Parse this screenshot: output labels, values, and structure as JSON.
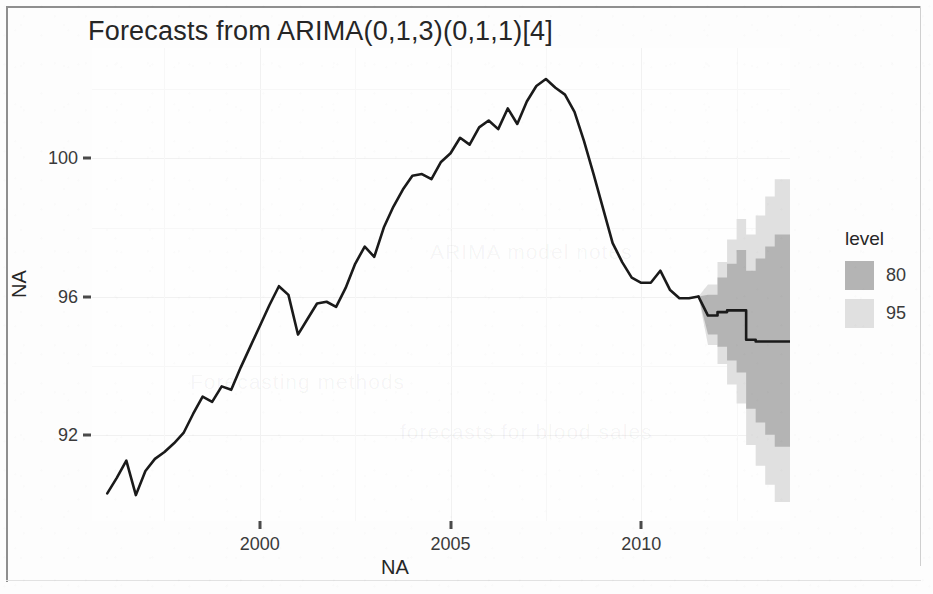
{
  "chart_data": {
    "type": "line",
    "title": "Forecasts from ARIMA(0,1,3)(0,1,1)[4]",
    "xlabel": "NA",
    "ylabel": "NA",
    "xlim": [
      1995.6,
      2013.9
    ],
    "ylim": [
      89.5,
      103.2
    ],
    "xticks": [
      2000,
      2005,
      2010
    ],
    "xtick_labels": [
      "2000",
      "2005",
      "2010"
    ],
    "yticks": [
      92,
      96,
      100
    ],
    "ytick_labels": [
      "92",
      "96",
      "100"
    ],
    "grid": true,
    "legend": {
      "title": "level",
      "position": "right",
      "entries": [
        {
          "label": "80",
          "color": "#b4b4b4"
        },
        {
          "label": "95",
          "color": "#e0e0e0"
        }
      ]
    },
    "series": [
      {
        "name": "observed",
        "color": "#1a1a1a",
        "x": [
          1996.0,
          1996.25,
          1996.5,
          1996.75,
          1997.0,
          1997.25,
          1997.5,
          1997.75,
          1998.0,
          1998.25,
          1998.5,
          1998.75,
          1999.0,
          1999.25,
          1999.5,
          1999.75,
          2000.0,
          2000.25,
          2000.5,
          2000.75,
          2001.0,
          2001.25,
          2001.5,
          2001.75,
          2002.0,
          2002.25,
          2002.5,
          2002.75,
          2003.0,
          2003.25,
          2003.5,
          2003.75,
          2004.0,
          2004.25,
          2004.5,
          2004.75,
          2005.0,
          2005.25,
          2005.5,
          2005.75,
          2006.0,
          2006.25,
          2006.5,
          2006.75,
          2007.0,
          2007.25,
          2007.5,
          2007.75,
          2008.0,
          2008.25,
          2008.5,
          2008.75,
          2009.0,
          2009.25,
          2009.5,
          2009.75,
          2010.0,
          2010.25,
          2010.5,
          2010.75,
          2011.0,
          2011.25,
          2011.5
        ],
        "values": [
          90.3,
          90.75,
          91.25,
          90.25,
          90.95,
          91.3,
          91.5,
          91.75,
          92.05,
          92.6,
          93.1,
          92.95,
          93.4,
          93.3,
          93.95,
          94.55,
          95.15,
          95.75,
          96.3,
          96.05,
          94.9,
          95.35,
          95.8,
          95.85,
          95.7,
          96.25,
          96.95,
          97.45,
          97.15,
          98.0,
          98.6,
          99.1,
          99.5,
          99.55,
          99.4,
          99.9,
          100.15,
          100.6,
          100.4,
          100.9,
          101.1,
          100.85,
          101.45,
          101.0,
          101.65,
          102.1,
          102.3,
          102.05,
          101.85,
          101.35,
          100.5,
          99.55,
          98.55,
          97.55,
          97.0,
          96.55,
          96.4,
          96.4,
          96.75,
          96.2,
          95.95,
          95.95,
          96.0
        ]
      },
      {
        "name": "forecast",
        "color": "#1a1a1a",
        "x": [
          2011.75,
          2012.0,
          2012.25,
          2012.5,
          2012.75,
          2013.0,
          2013.25,
          2013.5
        ],
        "values": [
          95.45,
          95.55,
          95.6,
          95.6,
          94.75,
          94.7,
          94.7,
          94.7
        ]
      }
    ],
    "intervals": [
      {
        "level": 95,
        "color": "#e0e0e0",
        "x": [
          2011.75,
          2012.0,
          2012.25,
          2012.5,
          2012.75,
          2013.0,
          2013.25,
          2013.5
        ],
        "lower": [
          94.6,
          94.05,
          93.45,
          92.9,
          91.7,
          91.1,
          90.55,
          90.05
        ],
        "upper": [
          96.35,
          97.0,
          97.65,
          98.25,
          97.8,
          98.35,
          98.9,
          99.4
        ]
      },
      {
        "level": 80,
        "color": "#b4b4b4",
        "x": [
          2011.75,
          2012.0,
          2012.25,
          2012.5,
          2012.75,
          2013.0,
          2013.25,
          2013.5
        ],
        "lower": [
          94.9,
          94.55,
          94.15,
          93.8,
          92.75,
          92.35,
          92.0,
          91.65
        ],
        "upper": [
          96.05,
          96.55,
          96.95,
          97.35,
          96.75,
          97.1,
          97.45,
          97.8
        ]
      }
    ],
    "ghost_marks": [
      {
        "text": "Forecasting methods",
        "x": 190,
        "y": 370
      },
      {
        "text": "forecasts for blood sales",
        "x": 400,
        "y": 420
      },
      {
        "text": "ARIMA model notes",
        "x": 430,
        "y": 240
      }
    ]
  }
}
